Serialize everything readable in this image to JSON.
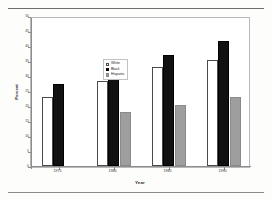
{
  "figure": {
    "y_axis_title": "Percent",
    "x_axis_title": "Year"
  },
  "legend": {
    "items": [
      {
        "label": "White",
        "swatch": "white-open-bar-swatch",
        "color": "#ffffff"
      },
      {
        "label": "Black",
        "swatch": "black-solid-bar-swatch",
        "color": "#111111"
      },
      {
        "label": "Hispanic",
        "swatch": "gray-solid-bar-swatch",
        "color": "#9e9e9e"
      }
    ]
  },
  "y_ticks": [
    "0",
    "5",
    "10",
    "15",
    "20",
    "25",
    "30",
    "35",
    "40",
    "45",
    "50"
  ],
  "chart_data": {
    "type": "bar",
    "title": "",
    "xlabel": "Year",
    "ylabel": "Percent",
    "categories": [
      "1975",
      "1980",
      "1985",
      "1990"
    ],
    "series": [
      {
        "name": "White",
        "color": "#ffffff",
        "values": [
          23,
          28.5,
          33,
          35.4
        ]
      },
      {
        "name": "Black",
        "color": "#111111",
        "values": [
          27.5,
          35,
          37,
          41.7
        ]
      },
      {
        "name": "Hispanic",
        "color": "#9e9e9e",
        "values": [
          null,
          18,
          20.5,
          23
        ]
      }
    ],
    "ylim": [
      0,
      50
    ],
    "ytick_step": 5,
    "grid": false,
    "legend_position": "inside-upper-left"
  }
}
